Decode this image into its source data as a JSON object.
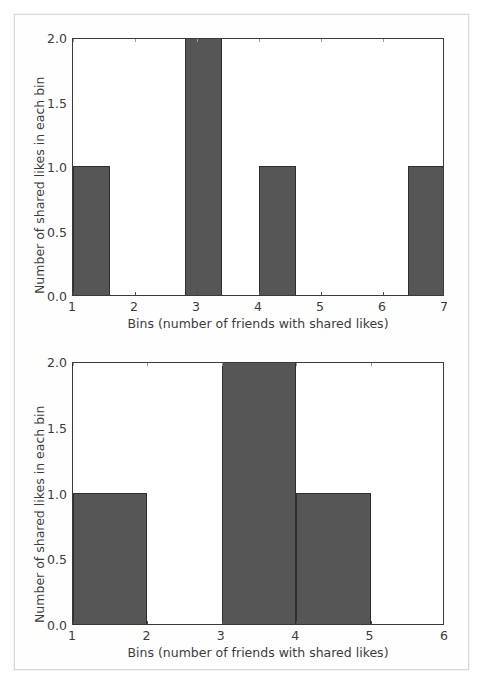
{
  "page": {
    "background_color": "#ffffff",
    "frame_color": "#d8d8d8"
  },
  "style": {
    "bar_color": "#565656",
    "bar_edge_color": "#2f2f2f",
    "axis_color": "#3a3a3a",
    "text_color": "#3c3c3c"
  },
  "chart_data": [
    {
      "id": "histogram-top",
      "type": "bar",
      "title": "",
      "xlabel": "Bins (number of friends with shared likes)",
      "ylabel": "Number of shared likes in each bin",
      "xlim": [
        1,
        7
      ],
      "ylim": [
        0.0,
        2.0
      ],
      "grid": false,
      "legend": false,
      "xticks": [
        1,
        2,
        3,
        4,
        5,
        6,
        7
      ],
      "xticklabels": [
        "1",
        "2",
        "3",
        "4",
        "5",
        "6",
        "7"
      ],
      "yticks": [
        0.0,
        0.5,
        1.0,
        1.5,
        2.0
      ],
      "yticklabels": [
        "0.0",
        "0.5",
        "1.0",
        "1.5",
        "2.0"
      ],
      "bin_width": 0.6,
      "bin_edges": [
        1.0,
        1.6,
        2.2,
        2.8,
        3.4,
        4.0,
        4.6,
        5.2,
        5.8,
        6.4,
        7.0
      ],
      "values": [
        1,
        0,
        0,
        2,
        0,
        1,
        0,
        0,
        0,
        1
      ],
      "bars": [
        {
          "x0": 1.0,
          "x1": 1.6,
          "height": 1
        },
        {
          "x0": 2.8,
          "x1": 3.4,
          "height": 2
        },
        {
          "x0": 4.0,
          "x1": 4.6,
          "height": 1
        },
        {
          "x0": 6.4,
          "x1": 7.0,
          "height": 1
        }
      ]
    },
    {
      "id": "histogram-bottom",
      "type": "bar",
      "title": "",
      "xlabel": "Bins (number of friends with shared likes)",
      "ylabel": "Number of shared likes in each bin",
      "xlim": [
        1,
        6
      ],
      "ylim": [
        0.0,
        2.0
      ],
      "grid": false,
      "legend": false,
      "xticks": [
        1,
        2,
        3,
        4,
        5,
        6
      ],
      "xticklabels": [
        "1",
        "2",
        "3",
        "4",
        "5",
        "6"
      ],
      "yticks": [
        0.0,
        0.5,
        1.0,
        1.5,
        2.0
      ],
      "yticklabels": [
        "0.0",
        "0.5",
        "1.0",
        "1.5",
        "2.0"
      ],
      "bin_width": 1.0,
      "bin_edges": [
        1.0,
        2.0,
        3.0,
        4.0,
        5.0,
        6.0
      ],
      "values": [
        1,
        0,
        2,
        1,
        0
      ],
      "bars": [
        {
          "x0": 1.0,
          "x1": 2.0,
          "height": 1
        },
        {
          "x0": 3.0,
          "x1": 4.0,
          "height": 2
        },
        {
          "x0": 4.0,
          "x1": 5.0,
          "height": 1
        }
      ]
    }
  ]
}
